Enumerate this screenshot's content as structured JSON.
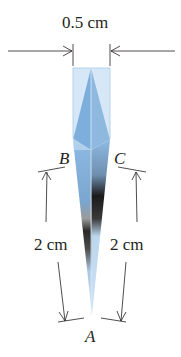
{
  "diagram": {
    "width_label": "0.5 cm",
    "left_length_label": "2 cm",
    "right_length_label": "2 cm",
    "points": {
      "A": "A",
      "B": "B",
      "C": "C"
    },
    "colors": {
      "glass_light": "#d6e8f7",
      "glass_mid": "#8db9e2",
      "glass_dark": "#5a8fc4",
      "shadow": "#1a1a1a",
      "line": "#231f20"
    }
  }
}
